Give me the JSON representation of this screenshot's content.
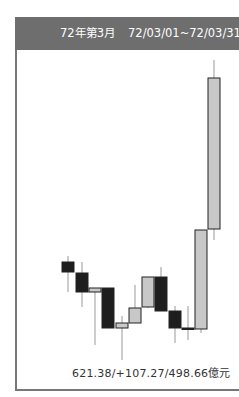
{
  "header": {
    "period": "72年第3月",
    "range": "72/03/01~72/03/31"
  },
  "footer": {
    "summary": "621.38/+107.27/498.66億元"
  },
  "colors": {
    "header_bg": "#6e6e6e",
    "up_candle": "#c8c8c8",
    "down_candle": "#1e1e1e",
    "wick": "#999999"
  },
  "chart_data": {
    "type": "candlestick",
    "title": "72年第3月 72/03/01~72/03/31",
    "annotation": "621.38/+107.27/498.66億元",
    "grid": false,
    "candles_pixel": [
      {
        "x": 62,
        "open_y": 262,
        "close_y": 272,
        "high_y": 256,
        "low_y": 292,
        "dir": "down"
      },
      {
        "x": 76,
        "open_y": 273,
        "close_y": 292,
        "high_y": 262,
        "low_y": 307,
        "dir": "down"
      },
      {
        "x": 89,
        "open_y": 292,
        "close_y": 288,
        "high_y": 288,
        "low_y": 345,
        "dir": "up"
      },
      {
        "x": 102,
        "open_y": 288,
        "close_y": 328,
        "high_y": 288,
        "low_y": 328,
        "dir": "down"
      },
      {
        "x": 116,
        "open_y": 328,
        "close_y": 323,
        "high_y": 316,
        "low_y": 360,
        "dir": "up"
      },
      {
        "x": 129,
        "open_y": 323,
        "close_y": 308,
        "high_y": 285,
        "low_y": 323,
        "dir": "up"
      },
      {
        "x": 142,
        "open_y": 307,
        "close_y": 277,
        "high_y": 277,
        "low_y": 308,
        "dir": "up"
      },
      {
        "x": 155,
        "open_y": 277,
        "close_y": 311,
        "high_y": 267,
        "low_y": 311,
        "dir": "down"
      },
      {
        "x": 169,
        "open_y": 311,
        "close_y": 328,
        "high_y": 306,
        "low_y": 343,
        "dir": "down"
      },
      {
        "x": 182,
        "open_y": 328,
        "close_y": 329,
        "high_y": 306,
        "low_y": 340,
        "dir": "down"
      },
      {
        "x": 195,
        "open_y": 329,
        "close_y": 230,
        "high_y": 230,
        "low_y": 333,
        "dir": "up"
      },
      {
        "x": 208,
        "open_y": 229,
        "close_y": 78,
        "high_y": 60,
        "low_y": 240,
        "dir": "up"
      }
    ]
  }
}
